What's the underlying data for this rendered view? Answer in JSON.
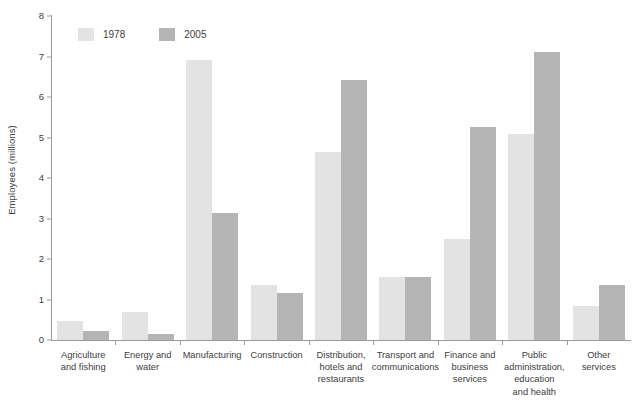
{
  "chart_data": {
    "type": "bar",
    "title": "",
    "xlabel": "",
    "ylabel": "Employees (millions)",
    "ylim": [
      0,
      8
    ],
    "yticks": [
      "0",
      "1",
      "2",
      "3",
      "4",
      "5",
      "6",
      "7",
      "8"
    ],
    "grid": false,
    "legend_position": "top-left",
    "categories": [
      "Agriculture and fishing",
      "Energy and water",
      "Manufacturing",
      "Construction",
      "Distribution, hotels and restaurants",
      "Transport and communications",
      "Finance and business services",
      "Public administration, education and health",
      "Other services"
    ],
    "category_lines": [
      [
        "Agriculture",
        "and fishing"
      ],
      [
        "Energy and",
        "water"
      ],
      [
        "Manufacturing"
      ],
      [
        "Construction"
      ],
      [
        "Distribution,",
        "hotels and",
        "restaurants"
      ],
      [
        "Transport and",
        "communications"
      ],
      [
        "Finance and",
        "business",
        "services"
      ],
      [
        "Public",
        "administration,",
        "education",
        "and health"
      ],
      [
        "Other",
        "services"
      ]
    ],
    "series": [
      {
        "name": "1978",
        "color": "#e3e3e3",
        "values": [
          0.47,
          0.7,
          6.92,
          1.36,
          4.64,
          1.55,
          2.49,
          5.08,
          0.84
        ]
      },
      {
        "name": "2005",
        "color": "#b5b5b5",
        "values": [
          0.22,
          0.15,
          3.13,
          1.16,
          6.42,
          1.55,
          5.26,
          7.11,
          1.36
        ]
      }
    ]
  },
  "axis": {
    "line_color": "#9a9a9a",
    "text_color": "#3d3d3d"
  }
}
